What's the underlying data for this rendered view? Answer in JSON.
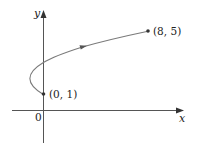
{
  "figure": {
    "type": "parametric-curve-plot",
    "axes": {
      "x_label": "x",
      "y_label": "y",
      "origin_label": "0"
    },
    "curve": {
      "description": "parametric curve from (0, 1) to (8, 5), bending left through vertex near (-1, 2) and crossing the y-axis at (0, 3), with a direction arrow",
      "direction": "from (0, 1) toward (8, 5)"
    },
    "points": [
      {
        "label": "(0, 1)",
        "x": 0,
        "y": 1
      },
      {
        "label": "(8, 5)",
        "x": 8,
        "y": 5
      }
    ],
    "colors": {
      "axis": "#555555",
      "curve": "#7a7a7a",
      "point": "#333333",
      "text": "#222222"
    }
  }
}
